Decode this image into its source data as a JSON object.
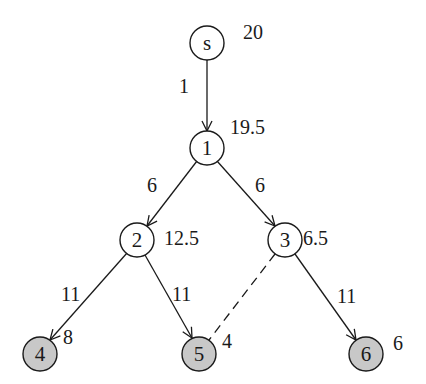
{
  "diagram": {
    "type": "search-tree",
    "colors": {
      "stroke": "#1a1a1a",
      "node_fill_plain": "#ffffff",
      "node_fill_leaf": "#c8c8c8"
    },
    "nodes": [
      {
        "id": "s",
        "label": "s",
        "value": "20",
        "cx": 207,
        "cy": 43,
        "shaded": false
      },
      {
        "id": "1",
        "label": "1",
        "value": "19.5",
        "cx": 207,
        "cy": 148,
        "shaded": false
      },
      {
        "id": "2",
        "label": "2",
        "value": "12.5",
        "cx": 137,
        "cy": 240,
        "shaded": false
      },
      {
        "id": "3",
        "label": "3",
        "value": "6.5",
        "cx": 285,
        "cy": 240,
        "shaded": false
      },
      {
        "id": "4",
        "label": "4",
        "value": "8",
        "cx": 40,
        "cy": 354,
        "shaded": true
      },
      {
        "id": "5",
        "label": "5",
        "value": "4",
        "cx": 199,
        "cy": 354,
        "shaded": true
      },
      {
        "id": "6",
        "label": "6",
        "value": "6",
        "cx": 366,
        "cy": 354,
        "shaded": true
      }
    ],
    "edges": [
      {
        "from": "s",
        "to": "1",
        "weight": "1",
        "style": "solid"
      },
      {
        "from": "1",
        "to": "2",
        "weight": "6",
        "style": "solid"
      },
      {
        "from": "1",
        "to": "3",
        "weight": "6",
        "style": "solid"
      },
      {
        "from": "2",
        "to": "4",
        "weight": "11",
        "style": "solid"
      },
      {
        "from": "2",
        "to": "5",
        "weight": "11",
        "style": "solid"
      },
      {
        "from": "3",
        "to": "6",
        "weight": "11",
        "style": "solid"
      },
      {
        "from": "3",
        "to": "5",
        "weight": "",
        "style": "dashed"
      }
    ]
  }
}
